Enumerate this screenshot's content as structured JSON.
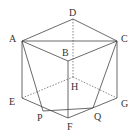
{
  "diagram": {
    "points": {
      "A": {
        "x": 22,
        "y": 41,
        "label": "A",
        "lx": 9,
        "ly": 42
      },
      "B": {
        "x": 68,
        "y": 61,
        "label": "B",
        "lx": 62,
        "ly": 56
      },
      "C": {
        "x": 117,
        "y": 41,
        "label": "C",
        "lx": 121,
        "ly": 42
      },
      "D": {
        "x": 73,
        "y": 19,
        "label": "D",
        "lx": 69,
        "ly": 16
      },
      "E": {
        "x": 22,
        "y": 98,
        "label": "E",
        "lx": 9,
        "ly": 105
      },
      "F": {
        "x": 68,
        "y": 118,
        "label": "F",
        "lx": 67,
        "ly": 130
      },
      "G": {
        "x": 117,
        "y": 98,
        "label": "G",
        "lx": 121,
        "ly": 107
      },
      "H": {
        "x": 73,
        "y": 77,
        "label": "H",
        "lx": 71,
        "ly": 90
      },
      "P": {
        "x": 43,
        "y": 111,
        "label": "P",
        "lx": 37,
        "ly": 121
      },
      "Q": {
        "x": 93,
        "y": 108,
        "label": "Q",
        "lx": 94,
        "ly": 120
      }
    },
    "solid_edges": [
      [
        "A",
        "D"
      ],
      [
        "D",
        "C"
      ],
      [
        "A",
        "C"
      ],
      [
        "A",
        "B"
      ],
      [
        "B",
        "C"
      ],
      [
        "B",
        "F"
      ],
      [
        "A",
        "E"
      ],
      [
        "C",
        "G"
      ],
      [
        "E",
        "F"
      ],
      [
        "F",
        "G"
      ],
      [
        "A",
        "P"
      ],
      [
        "C",
        "Q"
      ],
      [
        "P",
        "Q"
      ]
    ],
    "dashed_edges": [
      [
        "D",
        "H"
      ],
      [
        "E",
        "H"
      ],
      [
        "H",
        "G"
      ]
    ],
    "line_color": "#444444"
  }
}
